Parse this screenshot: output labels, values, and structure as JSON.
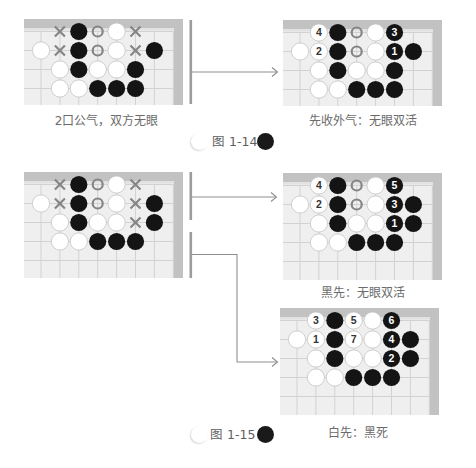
{
  "colors": {
    "black_stone": "#141414",
    "white_stone": "#ffffff",
    "white_stone_outline": "#c4c4c4",
    "board": "#efefef",
    "grid": "#d2d2d2",
    "frame": "#c2c2c2",
    "frame_inner": "#e2e2e2",
    "marker": "#858585",
    "number_on_black": "#ffffff",
    "number_on_white": "#333333",
    "connector": "#8f8f8f",
    "separator": "#9c9c9c",
    "caption_text": "#6b6b6b"
  },
  "figure_1_14": {
    "label": "图 1-14",
    "problem_board": {
      "caption": "2口公气，双方无眼",
      "markers": [
        {
          "r": 0,
          "c": 1,
          "type": "x"
        },
        {
          "r": 0,
          "c": 3,
          "type": "o"
        },
        {
          "r": 0,
          "c": 5,
          "type": "x"
        },
        {
          "r": 1,
          "c": 1,
          "type": "x"
        },
        {
          "r": 1,
          "c": 3,
          "type": "o"
        },
        {
          "r": 1,
          "c": 5,
          "type": "x"
        }
      ],
      "stones": [
        {
          "r": 0,
          "c": 2,
          "color": "black"
        },
        {
          "r": 0,
          "c": 4,
          "color": "white"
        },
        {
          "r": 1,
          "c": 0,
          "color": "white"
        },
        {
          "r": 1,
          "c": 2,
          "color": "black"
        },
        {
          "r": 1,
          "c": 4,
          "color": "white"
        },
        {
          "r": 1,
          "c": 6,
          "color": "black"
        },
        {
          "r": 2,
          "c": 1,
          "color": "white"
        },
        {
          "r": 2,
          "c": 2,
          "color": "black"
        },
        {
          "r": 2,
          "c": 3,
          "color": "white"
        },
        {
          "r": 2,
          "c": 4,
          "color": "white"
        },
        {
          "r": 2,
          "c": 5,
          "color": "black"
        },
        {
          "r": 3,
          "c": 1,
          "color": "white"
        },
        {
          "r": 3,
          "c": 2,
          "color": "white"
        },
        {
          "r": 3,
          "c": 3,
          "color": "black"
        },
        {
          "r": 3,
          "c": 4,
          "color": "black"
        },
        {
          "r": 3,
          "c": 5,
          "color": "black"
        }
      ]
    },
    "solution_board": {
      "caption": "先收外气：无眼双活",
      "markers": [
        {
          "r": 0,
          "c": 3,
          "type": "o"
        },
        {
          "r": 1,
          "c": 3,
          "type": "o"
        }
      ],
      "stones": [
        {
          "r": 0,
          "c": 1,
          "color": "white",
          "label": "4"
        },
        {
          "r": 0,
          "c": 2,
          "color": "black"
        },
        {
          "r": 0,
          "c": 4,
          "color": "white"
        },
        {
          "r": 0,
          "c": 5,
          "color": "black",
          "label": "3"
        },
        {
          "r": 1,
          "c": 0,
          "color": "white"
        },
        {
          "r": 1,
          "c": 1,
          "color": "white",
          "label": "2"
        },
        {
          "r": 1,
          "c": 2,
          "color": "black"
        },
        {
          "r": 1,
          "c": 4,
          "color": "white"
        },
        {
          "r": 1,
          "c": 5,
          "color": "black",
          "label": "1"
        },
        {
          "r": 1,
          "c": 6,
          "color": "black"
        },
        {
          "r": 2,
          "c": 1,
          "color": "white"
        },
        {
          "r": 2,
          "c": 2,
          "color": "black"
        },
        {
          "r": 2,
          "c": 3,
          "color": "white"
        },
        {
          "r": 2,
          "c": 4,
          "color": "white"
        },
        {
          "r": 2,
          "c": 5,
          "color": "black"
        },
        {
          "r": 3,
          "c": 1,
          "color": "white"
        },
        {
          "r": 3,
          "c": 2,
          "color": "white"
        },
        {
          "r": 3,
          "c": 3,
          "color": "black"
        },
        {
          "r": 3,
          "c": 4,
          "color": "black"
        },
        {
          "r": 3,
          "c": 5,
          "color": "black"
        }
      ]
    }
  },
  "figure_1_15": {
    "label": "图 1-15",
    "problem_board": {
      "markers": [
        {
          "r": 0,
          "c": 1,
          "type": "x"
        },
        {
          "r": 0,
          "c": 3,
          "type": "o"
        },
        {
          "r": 0,
          "c": 5,
          "type": "x"
        },
        {
          "r": 1,
          "c": 1,
          "type": "x"
        },
        {
          "r": 1,
          "c": 3,
          "type": "o"
        },
        {
          "r": 1,
          "c": 5,
          "type": "x"
        },
        {
          "r": 2,
          "c": 5,
          "type": "x"
        }
      ],
      "stones": [
        {
          "r": 0,
          "c": 2,
          "color": "black"
        },
        {
          "r": 0,
          "c": 4,
          "color": "white"
        },
        {
          "r": 1,
          "c": 0,
          "color": "white"
        },
        {
          "r": 1,
          "c": 2,
          "color": "black"
        },
        {
          "r": 1,
          "c": 4,
          "color": "white"
        },
        {
          "r": 1,
          "c": 6,
          "color": "black"
        },
        {
          "r": 2,
          "c": 1,
          "color": "white"
        },
        {
          "r": 2,
          "c": 2,
          "color": "black"
        },
        {
          "r": 2,
          "c": 3,
          "color": "white"
        },
        {
          "r": 2,
          "c": 4,
          "color": "white"
        },
        {
          "r": 2,
          "c": 6,
          "color": "black"
        },
        {
          "r": 3,
          "c": 1,
          "color": "white"
        },
        {
          "r": 3,
          "c": 2,
          "color": "white"
        },
        {
          "r": 3,
          "c": 3,
          "color": "black"
        },
        {
          "r": 3,
          "c": 4,
          "color": "black"
        },
        {
          "r": 3,
          "c": 5,
          "color": "black"
        }
      ]
    },
    "black_first_board": {
      "caption": "黑先：无眼双活",
      "markers": [
        {
          "r": 0,
          "c": 3,
          "type": "o"
        },
        {
          "r": 1,
          "c": 3,
          "type": "o"
        }
      ],
      "stones": [
        {
          "r": 0,
          "c": 1,
          "color": "white",
          "label": "4"
        },
        {
          "r": 0,
          "c": 2,
          "color": "black"
        },
        {
          "r": 0,
          "c": 4,
          "color": "white"
        },
        {
          "r": 0,
          "c": 5,
          "color": "black",
          "label": "5"
        },
        {
          "r": 1,
          "c": 0,
          "color": "white"
        },
        {
          "r": 1,
          "c": 1,
          "color": "white",
          "label": "2"
        },
        {
          "r": 1,
          "c": 2,
          "color": "black"
        },
        {
          "r": 1,
          "c": 4,
          "color": "white"
        },
        {
          "r": 1,
          "c": 5,
          "color": "black",
          "label": "3"
        },
        {
          "r": 1,
          "c": 6,
          "color": "black"
        },
        {
          "r": 2,
          "c": 1,
          "color": "white"
        },
        {
          "r": 2,
          "c": 2,
          "color": "black"
        },
        {
          "r": 2,
          "c": 3,
          "color": "white"
        },
        {
          "r": 2,
          "c": 4,
          "color": "white"
        },
        {
          "r": 2,
          "c": 5,
          "color": "black",
          "label": "1"
        },
        {
          "r": 2,
          "c": 6,
          "color": "black"
        },
        {
          "r": 3,
          "c": 1,
          "color": "white"
        },
        {
          "r": 3,
          "c": 2,
          "color": "white"
        },
        {
          "r": 3,
          "c": 3,
          "color": "black"
        },
        {
          "r": 3,
          "c": 4,
          "color": "black"
        },
        {
          "r": 3,
          "c": 5,
          "color": "black"
        }
      ]
    },
    "white_first_board": {
      "caption": "白先：黑死",
      "markers": [],
      "stones": [
        {
          "r": 0,
          "c": 1,
          "color": "white",
          "label": "3"
        },
        {
          "r": 0,
          "c": 2,
          "color": "black"
        },
        {
          "r": 0,
          "c": 3,
          "color": "white",
          "label": "5"
        },
        {
          "r": 0,
          "c": 4,
          "color": "white"
        },
        {
          "r": 0,
          "c": 5,
          "color": "black",
          "label": "6"
        },
        {
          "r": 1,
          "c": 0,
          "color": "white"
        },
        {
          "r": 1,
          "c": 1,
          "color": "white",
          "label": "1"
        },
        {
          "r": 1,
          "c": 2,
          "color": "black"
        },
        {
          "r": 1,
          "c": 3,
          "color": "white",
          "label": "7"
        },
        {
          "r": 1,
          "c": 4,
          "color": "white"
        },
        {
          "r": 1,
          "c": 5,
          "color": "black",
          "label": "4"
        },
        {
          "r": 1,
          "c": 6,
          "color": "black"
        },
        {
          "r": 2,
          "c": 1,
          "color": "white"
        },
        {
          "r": 2,
          "c": 2,
          "color": "black"
        },
        {
          "r": 2,
          "c": 3,
          "color": "white"
        },
        {
          "r": 2,
          "c": 4,
          "color": "white"
        },
        {
          "r": 2,
          "c": 5,
          "color": "black",
          "label": "2"
        },
        {
          "r": 2,
          "c": 6,
          "color": "black"
        },
        {
          "r": 3,
          "c": 1,
          "color": "white"
        },
        {
          "r": 3,
          "c": 2,
          "color": "white"
        },
        {
          "r": 3,
          "c": 3,
          "color": "black"
        },
        {
          "r": 3,
          "c": 4,
          "color": "black"
        },
        {
          "r": 3,
          "c": 5,
          "color": "black"
        }
      ]
    }
  }
}
